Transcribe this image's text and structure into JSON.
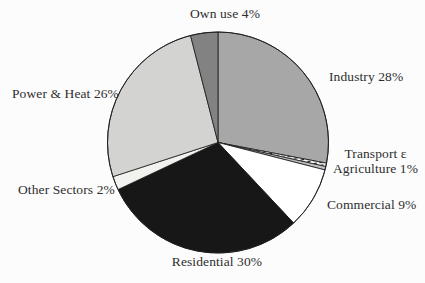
{
  "chart_data": {
    "type": "pie",
    "title": "",
    "unit": "%",
    "direction": "clockwise",
    "start_angle": "12-o'clock",
    "categories": [
      "Industry",
      "Transport & Agriculture",
      "Commercial",
      "Residential",
      "Other Sectors",
      "Power & Heat",
      "Own use"
    ],
    "values": [
      28,
      1,
      9,
      30,
      2,
      26,
      4
    ],
    "colors": {
      "industry": "#a7a7a7",
      "transport_agriculture_hatch": "hatch",
      "transport_agriculture_solid": "#bfbfbf",
      "commercial": "#ffffff",
      "residential": "#171717",
      "other_sectors": "#f2f2ef",
      "power_heat": "#d3d3d1",
      "own_use": "#828282",
      "outline": "#1b1b1b",
      "background": "#fcfcfc",
      "label_text": "#2e2e2e"
    },
    "pie": {
      "cx": 218,
      "cy": 142.5,
      "r": 110.5
    },
    "visual_slices": [
      {
        "name": "industry",
        "value": 28,
        "fill": "#a7a7a7"
      },
      {
        "name": "transport-agriculture-hatch",
        "value": 0.5,
        "fill": "hatch"
      },
      {
        "name": "transport-agriculture-solid",
        "value": 0.5,
        "fill": "#bfbfbf"
      },
      {
        "name": "commercial",
        "value": 9,
        "fill": "#ffffff"
      },
      {
        "name": "residential",
        "value": 30,
        "fill": "#171717"
      },
      {
        "name": "other-sectors",
        "value": 2,
        "fill": "#f2f2ef"
      },
      {
        "name": "power-heat",
        "value": 26,
        "fill": "#d3d3d1"
      },
      {
        "name": "own-use",
        "value": 4,
        "fill": "#828282"
      }
    ],
    "labels": [
      {
        "name": "own-use",
        "lines": [
          "Own use 4%"
        ],
        "left": 168,
        "top": 7,
        "width": 114,
        "align": "center"
      },
      {
        "name": "industry",
        "lines": [
          "Industry 28%"
        ],
        "left": 329,
        "top": 70,
        "width": 96,
        "align": "left"
      },
      {
        "name": "transport-agriculture",
        "lines": [
          "Transport ε",
          "Agriculture 1%"
        ],
        "left": 326,
        "top": 147,
        "width": 99,
        "align": "center"
      },
      {
        "name": "commercial",
        "lines": [
          "Commercial 9%"
        ],
        "left": 327,
        "top": 198,
        "width": 98,
        "align": "left"
      },
      {
        "name": "residential",
        "lines": [
          "Residential 30%"
        ],
        "left": 160,
        "top": 255,
        "width": 114,
        "align": "center"
      },
      {
        "name": "other-sectors",
        "lines": [
          "Other Sectors 2%"
        ],
        "left": 18,
        "top": 183,
        "width": 112,
        "align": "left"
      },
      {
        "name": "power-heat",
        "lines": [
          "Power & Heat 26%"
        ],
        "left": 12,
        "top": 87,
        "width": 112,
        "align": "left"
      }
    ]
  }
}
